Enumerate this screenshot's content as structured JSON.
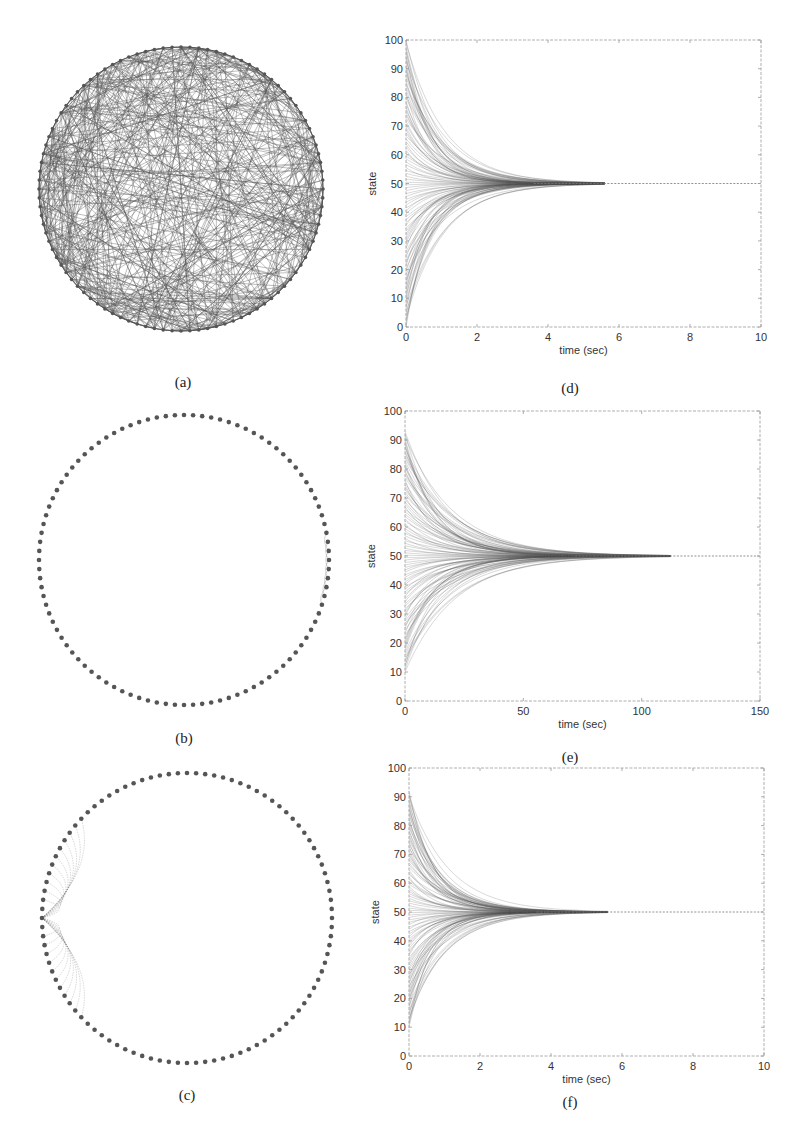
{
  "figure": {
    "panels": [
      {
        "id": "a",
        "label": "(a)",
        "type": "graph",
        "description": "dense random network on circle",
        "cx": 181,
        "cy": 189,
        "r": 142,
        "nodes": 100,
        "edges": "random-dense",
        "label_pos": [
          183,
          382
        ]
      },
      {
        "id": "b",
        "label": "(b)",
        "type": "graph",
        "description": "ring network with sparse local links",
        "cx": 184,
        "cy": 560,
        "r": 145,
        "nodes": 100,
        "edges": "ring-local",
        "label_pos": [
          184,
          738
        ]
      },
      {
        "id": "c",
        "label": "(c)",
        "type": "graph",
        "description": "ring network with star links from one node",
        "cx": 187,
        "cy": 918,
        "r": 145,
        "nodes": 100,
        "edges": "star-left",
        "label_pos": [
          187,
          1095
        ]
      },
      {
        "id": "d",
        "label": "(d)",
        "label_pos": [
          570,
          388
        ]
      },
      {
        "id": "e",
        "label": "(e)",
        "label_pos": [
          570,
          757
        ]
      },
      {
        "id": "f",
        "label": "(f)",
        "label_pos": [
          570,
          1102
        ]
      }
    ],
    "colors": {
      "ink": "#444444",
      "edge": "#555555",
      "node": "#555555",
      "axis": "#999999"
    }
  },
  "chart_data": [
    {
      "id": "d",
      "type": "line",
      "title": "",
      "xlabel": "time (sec)",
      "ylabel": "state",
      "xlim": [
        0,
        10
      ],
      "ylim": [
        0,
        100
      ],
      "xticks": [
        0,
        2,
        4,
        6,
        8,
        10
      ],
      "yticks": [
        0,
        10,
        20,
        30,
        40,
        50,
        60,
        70,
        80,
        90,
        100
      ],
      "series_description": "~100 state trajectories from initial values in [0,100] converging exponentially to consensus value 50 by t≈4 s",
      "consensus_value": 50,
      "convergence_time": 4,
      "initial_range": [
        0,
        100
      ],
      "box": [
        406,
        40,
        761,
        327
      ]
    },
    {
      "id": "e",
      "type": "line",
      "title": "",
      "xlabel": "time (sec)",
      "ylabel": "state",
      "xlim": [
        0,
        150
      ],
      "ylim": [
        0,
        100
      ],
      "xticks": [
        0,
        50,
        100,
        150
      ],
      "yticks": [
        0,
        10,
        20,
        30,
        40,
        50,
        60,
        70,
        80,
        90,
        100
      ],
      "series_description": "~100 state trajectories from initial values in [10,93] converging to 50 by t≈80 s",
      "consensus_value": 50,
      "convergence_time": 80,
      "initial_range": [
        10,
        93
      ],
      "box": [
        405,
        411,
        760,
        701
      ]
    },
    {
      "id": "f",
      "type": "line",
      "title": "",
      "xlabel": "time (sec)",
      "ylabel": "state",
      "xlim": [
        0,
        10
      ],
      "ylim": [
        0,
        100
      ],
      "xticks": [
        0,
        2,
        4,
        6,
        8,
        10
      ],
      "yticks": [
        0,
        10,
        20,
        30,
        40,
        50,
        60,
        70,
        80,
        90,
        100
      ],
      "series_description": "~100 state trajectories from initial values in [10,92] converging to 50 by t≈4 s",
      "consensus_value": 50,
      "convergence_time": 4,
      "initial_range": [
        10,
        92
      ],
      "box": [
        409,
        768,
        764,
        1056
      ]
    }
  ]
}
